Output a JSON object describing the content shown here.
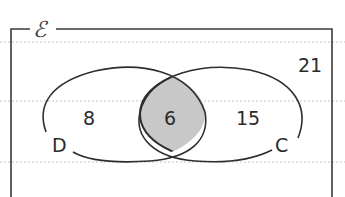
{
  "diagram": {
    "type": "venn",
    "universal_set": {
      "symbol": "ℰ",
      "outside_count": "21"
    },
    "sets": [
      {
        "name": "D",
        "label": "D",
        "only_count": "8"
      },
      {
        "name": "C",
        "label": "C",
        "only_count": "15"
      }
    ],
    "intersection": {
      "count": "6",
      "shaded": true
    },
    "colors": {
      "line": "#2e2e2e",
      "shade": "#c8c8c8",
      "rule": "#bdbdbd",
      "background": "#ffffff"
    }
  }
}
